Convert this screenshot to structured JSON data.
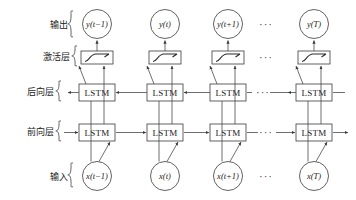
{
  "diagram": {
    "colors": {
      "stroke": "#3a3a3a",
      "line": "#4a4a4a",
      "text": "#1a1a1a",
      "background": "#ffffff"
    },
    "row_labels": [
      {
        "id": "output",
        "label": "输出"
      },
      {
        "id": "activation",
        "label": "激活层"
      },
      {
        "id": "backward",
        "label": "后向层"
      },
      {
        "id": "forward",
        "label": "前向层"
      },
      {
        "id": "input",
        "label": "输入"
      }
    ],
    "output_nodes": [
      {
        "label": "y(t−1)"
      },
      {
        "label": "y(t)"
      },
      {
        "label": "y(t+1)"
      },
      {
        "label": "y(T)"
      }
    ],
    "input_nodes": [
      {
        "label": "x(t−1)"
      },
      {
        "label": "x(t)"
      },
      {
        "label": "x(t+1)"
      },
      {
        "label": "x(T)"
      }
    ],
    "activation_boxes": [
      {
        "symbol": "sigmoid-curve"
      },
      {
        "symbol": "sigmoid-curve"
      },
      {
        "symbol": "sigmoid-curve"
      },
      {
        "symbol": "sigmoid-curve"
      }
    ],
    "backward_cells": [
      {
        "label": "LSTM"
      },
      {
        "label": "LSTM"
      },
      {
        "label": "LSTM"
      },
      {
        "label": "LSTM"
      }
    ],
    "forward_cells": [
      {
        "label": "LSTM"
      },
      {
        "label": "LSTM"
      },
      {
        "label": "LSTM"
      },
      {
        "label": "LSTM"
      }
    ],
    "ellipses": [
      {
        "row": "output",
        "label": "···"
      },
      {
        "row": "activation",
        "label": "···"
      },
      {
        "row": "backward",
        "label": "···"
      },
      {
        "row": "forward",
        "label": "···"
      },
      {
        "row": "input",
        "label": "···"
      }
    ]
  }
}
